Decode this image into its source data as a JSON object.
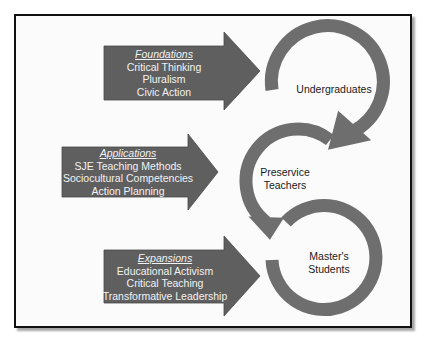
{
  "colors": {
    "arrow_fill": "#5f5f5f",
    "ring_fill": "#6e6e6e",
    "frame_border": "#111111",
    "background": "#fbfbfb",
    "arrow_text": "#f2f2f2",
    "node_text": "#1a1a1a"
  },
  "stages": [
    {
      "heading": "Foundations",
      "items": [
        "Critical Thinking",
        "Pluralism",
        "Civic Action"
      ],
      "node_lines": [
        "Undergraduates"
      ]
    },
    {
      "heading": "Applications",
      "items": [
        "SJE Teaching Methods",
        "Sociocultural Competencies",
        "Action Planning"
      ],
      "node_lines": [
        "Preservice",
        "Teachers"
      ]
    },
    {
      "heading": "Expansions",
      "items": [
        "Educational Activism",
        "Critical Teaching",
        "Transformative Leadership"
      ],
      "node_lines": [
        "Master's",
        "Students"
      ]
    }
  ]
}
